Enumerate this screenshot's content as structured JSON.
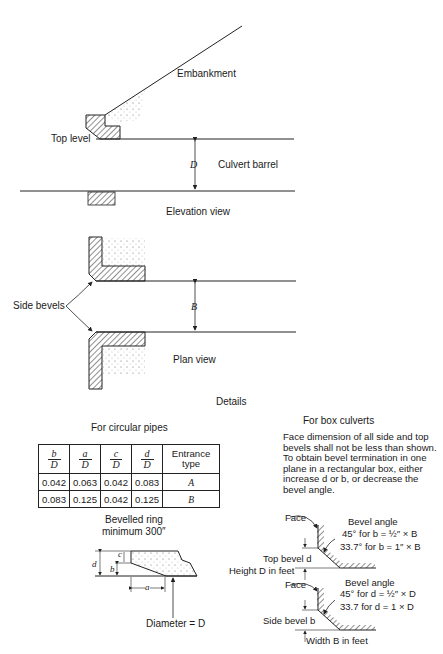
{
  "elevation": {
    "embankment": "Embankment",
    "top_level": "Top level",
    "dimension": "D",
    "barrel": "Culvert barrel",
    "caption": "Elevation view"
  },
  "plan": {
    "side_bevels": "Side bevels",
    "dimension": "B",
    "caption": "Plan view"
  },
  "details": {
    "title": "Details",
    "circular": {
      "title": "For circular pipes",
      "table": {
        "headers": [
          {
            "num": "b",
            "den": "D"
          },
          {
            "num": "a",
            "den": "D"
          },
          {
            "num": "c",
            "den": "D"
          },
          {
            "num": "d",
            "den": "D"
          },
          {
            "text": "Entrance type"
          }
        ],
        "rows": [
          [
            "0.042",
            "0.063",
            "0.042",
            "0.083",
            "A"
          ],
          [
            "0.083",
            "0.125",
            "0.042",
            "0.125",
            "B"
          ]
        ]
      },
      "ring_line1": "Bevelled ring",
      "ring_line2": "minimum 300″",
      "labels": {
        "c": "c",
        "b": "b",
        "d": "d",
        "a": "a"
      },
      "diameter": "Diameter = D"
    },
    "box": {
      "title": "For box culverts",
      "note": "Face dimension of all side and top bevels shall not be less than shown. To obtain bevel termination in one plane in a rectangular box, either increase d or b, or decrease the bevel angle.",
      "top": {
        "face": "Face",
        "bevel_angle": "Bevel angle",
        "line1": "45°  for b = ½″ × B",
        "line2": "33.7°  for b = 1″ × B",
        "bevel_label": "Top bevel d",
        "height": "Height D in feet"
      },
      "side": {
        "face": "Face",
        "bevel_angle": "Bevel angle",
        "line1": "45° for d = ½″ × D",
        "line2": "33.7  for d = 1 × D",
        "bevel_label": "Side bevel b",
        "width": "Width B in feet"
      }
    }
  }
}
